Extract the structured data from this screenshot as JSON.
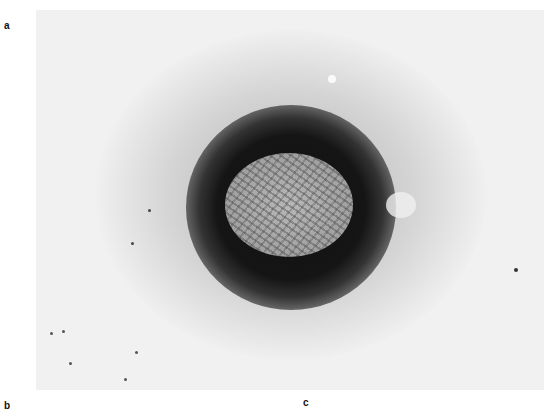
{
  "figure": {
    "panel_labels": [
      "a",
      "b",
      "c"
    ],
    "image_description": "Negative-stain electron micrograph of an enveloped virus particle with surface filaments, surrounded by a dark stain halo"
  }
}
